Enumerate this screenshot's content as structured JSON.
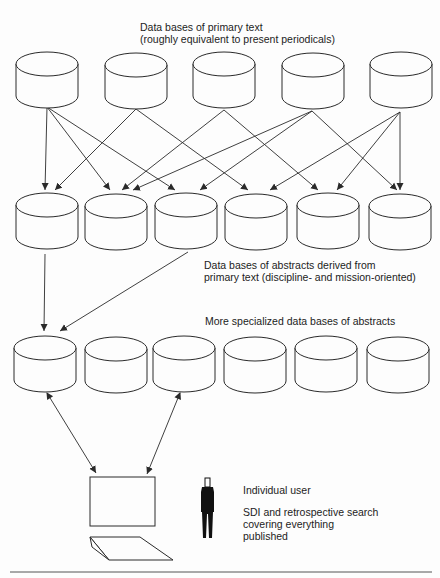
{
  "labels": {
    "primary_title": "Data bases of primary text",
    "primary_subtitle": "(roughly equivalent to present periodicals)",
    "abstracts_line1": "Data bases of abstracts derived from",
    "abstracts_line2": "primary text (discipline- and mission-oriented)",
    "specialized": "More specialized data bases of abstracts",
    "user": "Individual user",
    "search_line1": "SDI and retrospective search",
    "search_line2": "covering everything",
    "search_line3": "published"
  },
  "colors": {
    "stroke": "#2a2a2a",
    "background": "#fdfdfd",
    "figure": "#111111"
  },
  "rows": [
    {
      "name": "primary-text-databases",
      "count": 5,
      "centers_x": [
        47,
        136,
        224,
        313,
        401
      ],
      "top_y": 52,
      "rx": 31,
      "ry": 12,
      "height": 32
    },
    {
      "name": "abstract-databases",
      "count": 6,
      "centers_x": [
        47,
        116,
        186,
        256,
        328,
        400
      ],
      "top_y": 193,
      "rx": 31,
      "ry": 12,
      "height": 32
    },
    {
      "name": "specialized-abstract-databases",
      "count": 6,
      "centers_x": [
        45,
        116,
        184,
        255,
        326,
        398
      ],
      "top_y": 336,
      "rx": 31,
      "ry": 12,
      "height": 32
    }
  ],
  "arrows_row1_to_row2": [
    {
      "from": [
        47,
        107
      ],
      "to": [
        45,
        190
      ]
    },
    {
      "from": [
        47,
        107
      ],
      "to": [
        110,
        190
      ]
    },
    {
      "from": [
        47,
        107
      ],
      "to": [
        175,
        190
      ]
    },
    {
      "from": [
        136,
        109
      ],
      "to": [
        55,
        190
      ]
    },
    {
      "from": [
        136,
        109
      ],
      "to": [
        248,
        190
      ]
    },
    {
      "from": [
        224,
        110
      ],
      "to": [
        122,
        190
      ]
    },
    {
      "from": [
        224,
        110
      ],
      "to": [
        318,
        190
      ]
    },
    {
      "from": [
        312,
        111
      ],
      "to": [
        133,
        190
      ]
    },
    {
      "from": [
        312,
        111
      ],
      "to": [
        200,
        190
      ]
    },
    {
      "from": [
        312,
        111
      ],
      "to": [
        397,
        190
      ]
    },
    {
      "from": [
        400,
        112
      ],
      "to": [
        270,
        190
      ]
    },
    {
      "from": [
        400,
        112
      ],
      "to": [
        337,
        190
      ]
    },
    {
      "from": [
        400,
        112
      ],
      "to": [
        400,
        190
      ]
    }
  ],
  "arrows_row2_to_row3": [
    {
      "from": [
        45,
        254
      ],
      "to": [
        44,
        331
      ]
    },
    {
      "from": [
        188,
        252
      ],
      "to": [
        60,
        331
      ]
    }
  ],
  "double_arrows_row3_to_terminal": [
    {
      "from": [
        47,
        393
      ],
      "to": [
        96,
        473
      ]
    },
    {
      "from": [
        180,
        393
      ],
      "to": [
        147,
        474
      ]
    }
  ],
  "terminal": {
    "screen": {
      "x": 90,
      "y": 477,
      "w": 65,
      "h": 49
    },
    "keyboard": [
      [
        90,
        537
      ],
      [
        140,
        537
      ],
      [
        173,
        560
      ],
      [
        109,
        560
      ]
    ]
  }
}
